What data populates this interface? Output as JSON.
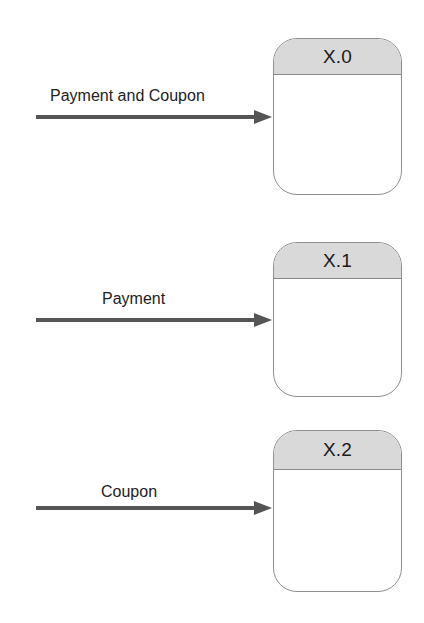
{
  "diagram": {
    "type": "data-flow-diagram",
    "colors": {
      "process_header_fill": "#d9d9d9",
      "process_border": "#8e8e8e",
      "arrow": "#555555",
      "text": "#222222"
    },
    "processes": [
      {
        "id": "X.0",
        "incoming_flow": "Payment and Coupon"
      },
      {
        "id": "X.1",
        "incoming_flow": "Payment"
      },
      {
        "id": "X.2",
        "incoming_flow": "Coupon"
      }
    ]
  }
}
